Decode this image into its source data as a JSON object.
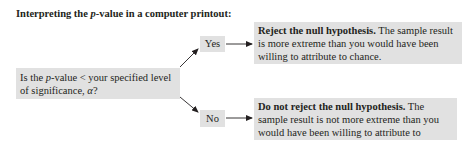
{
  "title": {
    "prefix": "Interpreting the ",
    "italic": "p",
    "suffix": "-value in a computer printout:"
  },
  "question": {
    "part1": "Is the ",
    "italic_p": "p",
    "part2": "-value < your specified level of significance, ",
    "italic_alpha": "α",
    "part3": "?"
  },
  "branches": {
    "yes": {
      "label": "Yes",
      "outcome_bold": "Reject the null hypothesis.",
      "outcome_text": " The sample result is more extreme than you would have been willing to attribute to chance."
    },
    "no": {
      "label": "No",
      "outcome_bold": "Do not reject the null hypothesis.",
      "outcome_text": " The sample result is not more extreme than you would have been willing to attribute to chance."
    }
  },
  "colors": {
    "box_fill": "#e1e1e1",
    "text": "#231f20",
    "arrow": "#231f20"
  }
}
